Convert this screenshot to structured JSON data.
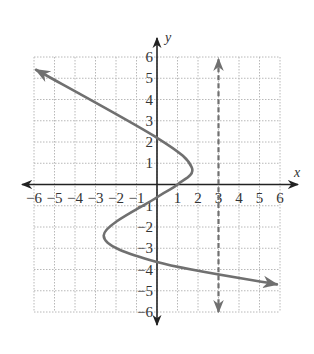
{
  "chart_data": {
    "type": "line",
    "title": "",
    "xlabel": "x",
    "ylabel": "y",
    "xlim": [
      -6,
      6
    ],
    "ylim": [
      -6,
      6
    ],
    "grid": true,
    "x_ticks": [
      "-6",
      "-5",
      "-4",
      "-3",
      "-2",
      "-1",
      "1",
      "2",
      "3",
      "4",
      "5",
      "6"
    ],
    "y_ticks": [
      "6",
      "5",
      "4",
      "3",
      "2",
      "1",
      "-1",
      "-2",
      "-3",
      "-4",
      "-5",
      "-6"
    ],
    "series": [
      {
        "name": "curve",
        "style": "solid",
        "color": "#707070",
        "description": "Sideways S-shaped curve (x as a function of y) with arrows at both ends",
        "points": [
          {
            "x": -5.9,
            "y": 5.4
          },
          {
            "x": 0,
            "y": 2.2
          },
          {
            "x": 1.7,
            "y": 0.8
          },
          {
            "x": 1.0,
            "y": 0
          },
          {
            "x": 0,
            "y": -0.6
          },
          {
            "x": -2.6,
            "y": -2.4
          },
          {
            "x": 0,
            "y": -3.65
          },
          {
            "x": 5.85,
            "y": -4.7
          }
        ]
      },
      {
        "name": "vertical-line-x=3",
        "style": "dashed",
        "color": "#707070",
        "description": "Dashed vertical line x = 3 with arrows at both ends",
        "points": [
          {
            "x": 3,
            "y": 5.9
          },
          {
            "x": 3,
            "y": -6
          }
        ]
      }
    ]
  },
  "colors": {
    "axis": "#222222",
    "grid": "#b8b8b8",
    "curve": "#707070",
    "background": "#ffffff"
  }
}
